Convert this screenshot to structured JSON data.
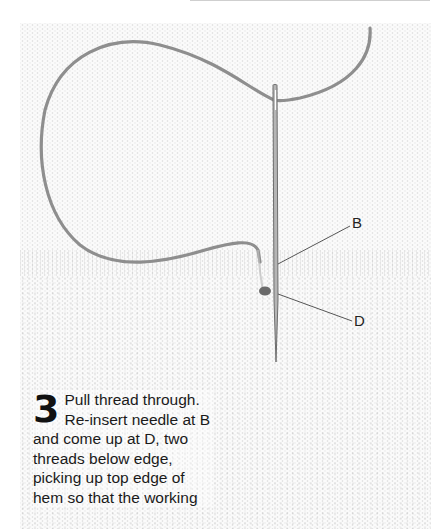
{
  "illustration": {
    "description": "Needle and thread stitching through hem fabric",
    "labels": [
      {
        "id": "B",
        "text": "B"
      },
      {
        "id": "D",
        "text": "D"
      }
    ],
    "colors": {
      "thread": "#8e8e8e",
      "needle": "#7a7a7a",
      "knot": "#6a6a6a",
      "leader_line": "#555555"
    }
  },
  "instruction": {
    "step_number": "3",
    "text": "Pull thread through. Re-insert needle at B and come up at D, two threads below edge, picking up top edge of hem so that the working"
  }
}
